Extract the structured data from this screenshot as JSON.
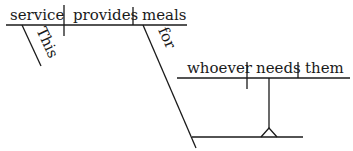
{
  "diagram": {
    "type": "sentence-diagram",
    "main_clause": {
      "subject": "service",
      "verb": "provides",
      "direct_object": "meals",
      "subject_modifier": "This",
      "preposition": "for"
    },
    "noun_clause": {
      "subject": "whoever",
      "verb": "needs",
      "direct_object": "them"
    },
    "colors": {
      "ink": "#1a1a1a",
      "background": "#ffffff"
    }
  }
}
